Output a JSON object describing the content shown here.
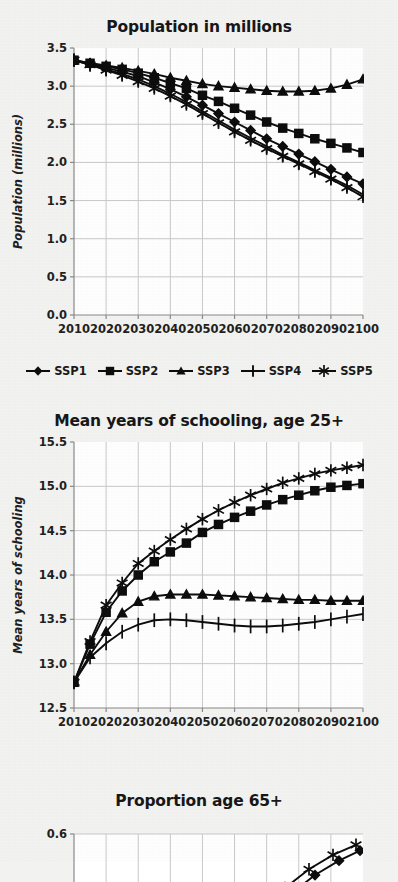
{
  "figure": {
    "background_color": "#f3f3f1",
    "ink_color": "#0d0d0d",
    "grid_color": "#c9c9c9"
  },
  "legend": {
    "position": "below-first-panel",
    "items": [
      {
        "label": "SSP1",
        "marker": "diamond"
      },
      {
        "label": "SSP2",
        "marker": "square"
      },
      {
        "label": "SSP3",
        "marker": "triangle"
      },
      {
        "label": "SSP4",
        "marker": "plus"
      },
      {
        "label": "SSP5",
        "marker": "asterisk"
      }
    ]
  },
  "chart_data": [
    {
      "id": "population",
      "type": "line",
      "title": "Population in millions",
      "xlabel": "",
      "ylabel": "Population (millions)",
      "xlim": [
        2010,
        2100
      ],
      "ylim": [
        0.0,
        3.5
      ],
      "grid": true,
      "legend": "below",
      "x": [
        2010,
        2015,
        2020,
        2025,
        2030,
        2035,
        2040,
        2045,
        2050,
        2055,
        2060,
        2065,
        2070,
        2075,
        2080,
        2085,
        2090,
        2095,
        2100
      ],
      "xticks": [
        2010,
        2020,
        2030,
        2040,
        2050,
        2060,
        2070,
        2080,
        2090,
        2100
      ],
      "yticks": [
        0.0,
        0.5,
        1.0,
        1.5,
        2.0,
        2.5,
        3.0,
        3.5
      ],
      "ytick_labels": [
        "0.0",
        "0.5",
        "1.0",
        "1.5",
        "2.0",
        "2.5",
        "3.0",
        "3.5"
      ],
      "series": [
        {
          "name": "SSP1",
          "marker": "diamond",
          "values": [
            3.34,
            3.29,
            3.24,
            3.19,
            3.13,
            3.05,
            2.96,
            2.86,
            2.75,
            2.64,
            2.53,
            2.42,
            2.31,
            2.21,
            2.11,
            2.01,
            1.91,
            1.81,
            1.72
          ]
        },
        {
          "name": "SSP2",
          "marker": "square",
          "values": [
            3.34,
            3.3,
            3.26,
            3.22,
            3.17,
            3.11,
            3.04,
            2.97,
            2.88,
            2.8,
            2.71,
            2.62,
            2.53,
            2.45,
            2.38,
            2.31,
            2.25,
            2.19,
            2.13
          ]
        },
        {
          "name": "SSP3",
          "marker": "triangle",
          "values": [
            3.34,
            3.3,
            3.27,
            3.24,
            3.2,
            3.16,
            3.11,
            3.07,
            3.03,
            3.0,
            2.98,
            2.96,
            2.94,
            2.93,
            2.93,
            2.94,
            2.97,
            3.02,
            3.09
          ]
        },
        {
          "name": "SSP4",
          "marker": "plus",
          "values": [
            3.34,
            3.28,
            3.22,
            3.16,
            3.09,
            3.0,
            2.9,
            2.79,
            2.67,
            2.55,
            2.43,
            2.32,
            2.21,
            2.1,
            2.0,
            1.9,
            1.8,
            1.7,
            1.58
          ]
        },
        {
          "name": "SSP5",
          "marker": "asterisk",
          "values": [
            3.34,
            3.28,
            3.21,
            3.14,
            3.06,
            2.97,
            2.87,
            2.76,
            2.64,
            2.52,
            2.4,
            2.29,
            2.18,
            2.08,
            1.98,
            1.88,
            1.78,
            1.67,
            1.55
          ]
        }
      ]
    },
    {
      "id": "schooling",
      "type": "line",
      "title": "Mean years of schooling, age 25+",
      "xlabel": "",
      "ylabel": "Mean years of schooling",
      "xlim": [
        2010,
        2100
      ],
      "ylim": [
        12.5,
        15.5
      ],
      "grid": true,
      "x": [
        2010,
        2015,
        2020,
        2025,
        2030,
        2035,
        2040,
        2045,
        2050,
        2055,
        2060,
        2065,
        2070,
        2075,
        2080,
        2085,
        2090,
        2095,
        2100
      ],
      "xticks": [
        2010,
        2020,
        2030,
        2040,
        2050,
        2060,
        2070,
        2080,
        2090,
        2100
      ],
      "yticks": [
        12.5,
        13.0,
        13.5,
        14.0,
        14.5,
        15.0,
        15.5
      ],
      "ytick_labels": [
        "12.5",
        "13.0",
        "13.5",
        "14.0",
        "14.5",
        "15.0",
        "15.5"
      ],
      "series": [
        {
          "name": "SSP2",
          "marker": "square",
          "values": [
            12.79,
            13.22,
            13.58,
            13.82,
            14.0,
            14.15,
            14.26,
            14.36,
            14.48,
            14.57,
            14.65,
            14.72,
            14.79,
            14.85,
            14.9,
            14.95,
            14.99,
            15.01,
            15.03
          ]
        },
        {
          "name": "SSP3",
          "marker": "triangle",
          "values": [
            12.79,
            13.1,
            13.36,
            13.57,
            13.7,
            13.76,
            13.78,
            13.78,
            13.78,
            13.77,
            13.76,
            13.75,
            13.74,
            13.73,
            13.72,
            13.72,
            13.71,
            13.71,
            13.71
          ]
        },
        {
          "name": "SSP4",
          "marker": "plus",
          "values": [
            12.79,
            13.07,
            13.23,
            13.36,
            13.44,
            13.49,
            13.5,
            13.49,
            13.47,
            13.45,
            13.43,
            13.42,
            13.42,
            13.43,
            13.45,
            13.47,
            13.5,
            13.53,
            13.56
          ]
        },
        {
          "name": "SSP5",
          "marker": "asterisk",
          "values": [
            12.79,
            13.25,
            13.66,
            13.91,
            14.13,
            14.27,
            14.4,
            14.52,
            14.63,
            14.73,
            14.82,
            14.9,
            14.97,
            15.04,
            15.09,
            15.14,
            15.18,
            15.21,
            15.24
          ]
        }
      ]
    },
    {
      "id": "proportion65",
      "type": "line",
      "title": "Proportion age 65+",
      "xlabel": "",
      "ylabel": "",
      "xlim": [
        2010,
        2100
      ],
      "ylim": [
        0.5,
        0.6
      ],
      "grid": true,
      "clipped": true,
      "yticks": [
        0.5,
        0.6
      ],
      "ytick_labels": [
        "0.5",
        "0.6"
      ],
      "series": [
        {
          "name": "SSP1",
          "marker": "diamond",
          "values": [
            0.52,
            0.545,
            0.565,
            0.578
          ]
        },
        {
          "name": "SSP5",
          "marker": "asterisk",
          "values": [
            0.525,
            0.552,
            0.572,
            0.585
          ]
        }
      ]
    }
  ]
}
